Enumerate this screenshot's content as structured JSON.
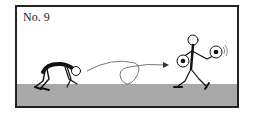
{
  "panel": {
    "label": "No. 9",
    "ground_color": "#a9a9a9",
    "border_color": "#222222"
  },
  "figures": [
    {
      "name": "crouching-stick-figure",
      "pose": "bent over, starting position"
    },
    {
      "name": "standing-stick-figure",
      "pose": "holding two soccer balls"
    }
  ],
  "arrow": {
    "name": "looping-arrow",
    "direction": "left-to-right"
  }
}
